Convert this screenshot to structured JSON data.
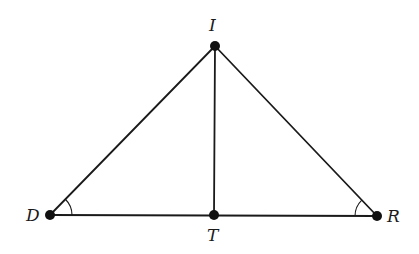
{
  "diagram": {
    "type": "geometry",
    "colors": {
      "stroke": "#1a1a1a",
      "point": "#111111",
      "background": "#ffffff"
    },
    "points": [
      {
        "id": "I",
        "label": "I",
        "x": 215,
        "y": 46
      },
      {
        "id": "D",
        "label": "D",
        "x": 50,
        "y": 215
      },
      {
        "id": "T",
        "label": "T",
        "x": 214,
        "y": 215
      },
      {
        "id": "R",
        "label": "R",
        "x": 377,
        "y": 216
      }
    ],
    "segments": [
      {
        "from": "D",
        "to": "I"
      },
      {
        "from": "I",
        "to": "R"
      },
      {
        "from": "D",
        "to": "R"
      },
      {
        "from": "I",
        "to": "T"
      }
    ],
    "angle_marks": [
      {
        "vertex": "D",
        "between": [
          "I",
          "R"
        ],
        "arcs": 1
      },
      {
        "vertex": "R",
        "between": [
          "I",
          "D"
        ],
        "arcs": 1
      }
    ]
  }
}
